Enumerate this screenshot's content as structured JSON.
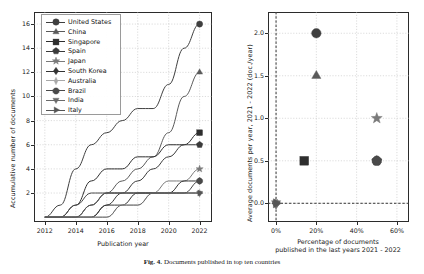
{
  "figure": {
    "caption_label": "Fig. 4.",
    "caption_text": "Documents published in top ten countries"
  },
  "left_panel": {
    "ylabel": "Accumulative number of documents",
    "xlabel": "Publication year",
    "yticks": [
      "2",
      "4",
      "6",
      "8",
      "10",
      "12",
      "14",
      "16"
    ],
    "xticks": [
      "2012",
      "2014",
      "2016",
      "2018",
      "2020",
      "2022"
    ]
  },
  "right_panel": {
    "ylabel": "Average documents per year, 2021 - 2022 (doc./year)",
    "xlabel_line1": "Percentage of documents",
    "xlabel_line2": "published in the last years 2021 - 2022",
    "yticks": [
      "0.0",
      "0.5",
      "1.0",
      "1.5",
      "2.0"
    ],
    "xticks": [
      "0%",
      "20%",
      "40%",
      "60%"
    ]
  },
  "legend": {
    "items": [
      {
        "label": "United States",
        "marker": "circle-marker",
        "color": "#3f3f3f"
      },
      {
        "label": "China",
        "marker": "triangle-up-marker",
        "color": "#5a5a5a"
      },
      {
        "label": "Singapore",
        "marker": "square-marker",
        "color": "#2e2e2e"
      },
      {
        "label": "Spain",
        "marker": "pentagon-marker",
        "color": "#3a3a3a"
      },
      {
        "label": "Japan",
        "marker": "star-marker",
        "color": "#7a7a7a"
      },
      {
        "label": "South Korea",
        "marker": "diamond-marker",
        "color": "#343434"
      },
      {
        "label": "Australia",
        "marker": "thin-diamond-marker",
        "color": "#a8a8a8"
      },
      {
        "label": "Brazil",
        "marker": "octagon-marker",
        "color": "#4a4a4a"
      },
      {
        "label": "India",
        "marker": "triangle-down-marker",
        "color": "#6b6b6b"
      },
      {
        "label": "Italy",
        "marker": "triangle-right-marker",
        "color": "#555555"
      }
    ]
  },
  "chart_data": [
    {
      "type": "line",
      "title": "Accumulative number of documents by publication year",
      "xlabel": "Publication year",
      "ylabel": "Accumulative number of documents",
      "xlim": [
        2011.3,
        2022.8
      ],
      "ylim": [
        -0.4,
        17.0
      ],
      "grid": true,
      "legend_position": "upper-left",
      "x": [
        2012,
        2013,
        2014,
        2015,
        2016,
        2017,
        2018,
        2019,
        2020,
        2021,
        2022
      ],
      "series": [
        {
          "name": "United States",
          "marker": "circle-marker",
          "color": "#3f3f3f",
          "values": [
            0,
            1,
            4,
            6,
            7,
            8,
            9,
            9,
            11,
            14,
            16
          ]
        },
        {
          "name": "China",
          "marker": "triangle-up-marker",
          "color": "#5a5a5a",
          "values": [
            0,
            0,
            0,
            1,
            2,
            3,
            4,
            5,
            7,
            10,
            12
          ]
        },
        {
          "name": "Singapore",
          "marker": "square-marker",
          "color": "#2e2e2e",
          "values": [
            0,
            0,
            1,
            3,
            4,
            4,
            5,
            5,
            6,
            6,
            7
          ]
        },
        {
          "name": "Spain",
          "marker": "pentagon-marker",
          "color": "#3a3a3a",
          "values": [
            0,
            0,
            0,
            0,
            1,
            2,
            3,
            4,
            5,
            6,
            6
          ]
        },
        {
          "name": "Japan",
          "marker": "star-marker",
          "color": "#7a7a7a",
          "values": [
            0,
            0,
            0,
            1,
            2,
            2,
            2,
            2,
            3,
            3,
            4
          ]
        },
        {
          "name": "South Korea",
          "marker": "diamond-marker",
          "color": "#343434",
          "values": [
            0,
            0,
            0,
            0,
            1,
            1,
            2,
            2,
            2,
            3,
            3
          ]
        },
        {
          "name": "Australia",
          "marker": "thin-diamond-marker",
          "color": "#a8a8a8",
          "values": [
            0,
            0,
            0,
            0,
            0,
            1,
            1,
            2,
            2,
            2,
            2
          ]
        },
        {
          "name": "Brazil",
          "marker": "octagon-marker",
          "color": "#4a4a4a",
          "values": [
            0,
            0,
            1,
            2,
            2,
            2,
            2,
            2,
            2,
            2,
            3
          ]
        },
        {
          "name": "India",
          "marker": "triangle-down-marker",
          "color": "#6b6b6b",
          "values": [
            0,
            0,
            0,
            0,
            0,
            1,
            1,
            2,
            2,
            2,
            2
          ]
        },
        {
          "name": "Italy",
          "marker": "triangle-right-marker",
          "color": "#555555",
          "values": [
            0,
            0,
            0,
            1,
            2,
            2,
            2,
            2,
            2,
            2,
            2
          ]
        }
      ]
    },
    {
      "type": "scatter",
      "title": "Average documents per year vs percentage published 2021-2022",
      "xlabel": "Percentage of documents published in the last years 2021 - 2022",
      "ylabel": "Average documents per year, 2021 - 2022 (doc./year)",
      "xlim": [
        -4,
        66
      ],
      "ylim": [
        -0.22,
        2.25
      ],
      "grid": true,
      "points": [
        {
          "name": "United States",
          "x": 20,
          "y": 2.0,
          "marker": "circle-marker",
          "color": "#3f3f3f"
        },
        {
          "name": "China",
          "x": 20,
          "y": 1.5,
          "marker": "triangle-up-marker",
          "color": "#5a5a5a"
        },
        {
          "name": "Japan",
          "x": 50,
          "y": 1.0,
          "marker": "star-marker",
          "color": "#7a7a7a"
        },
        {
          "name": "Singapore",
          "x": 14,
          "y": 0.5,
          "marker": "square-marker",
          "color": "#2e2e2e"
        },
        {
          "name": "Spain",
          "x": 50,
          "y": 0.5,
          "marker": "pentagon-marker",
          "color": "#3a3a3a"
        },
        {
          "name": "Brazil",
          "x": 50,
          "y": 0.5,
          "marker": "octagon-marker",
          "color": "#4a4a4a"
        },
        {
          "name": "South Korea",
          "x": 0,
          "y": 0.0,
          "marker": "diamond-marker",
          "color": "#343434"
        },
        {
          "name": "Australia",
          "x": 0,
          "y": 0.0,
          "marker": "thin-diamond-marker",
          "color": "#a8a8a8"
        },
        {
          "name": "India",
          "x": 0,
          "y": 0.0,
          "marker": "triangle-down-marker",
          "color": "#6b6b6b"
        },
        {
          "name": "Italy",
          "x": 0,
          "y": 0.0,
          "marker": "triangle-right-marker",
          "color": "#555555"
        }
      ]
    }
  ]
}
